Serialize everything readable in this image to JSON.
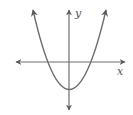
{
  "graph": {
    "x_axis_label": "x",
    "y_axis_label": "y",
    "curve": "upward-opening parabola",
    "colors": {
      "curve": "#6e6e6e",
      "axes": "#6e6e6e",
      "label": "#555555",
      "background": "#ffffff"
    }
  }
}
